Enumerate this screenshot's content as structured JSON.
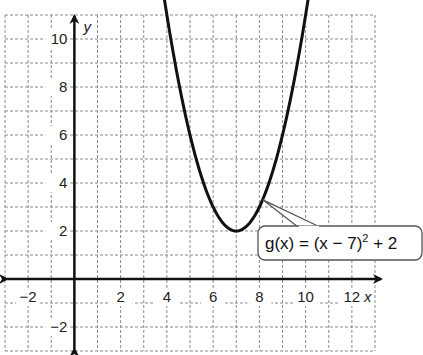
{
  "chart_data": {
    "type": "line",
    "title": "",
    "xlabel": "x",
    "ylabel": "y",
    "xlim": [
      -3,
      13
    ],
    "ylim": [
      -3,
      11
    ],
    "grid": true,
    "grid_style": "dashed",
    "x_ticks": [
      -2,
      2,
      4,
      6,
      8,
      10,
      12
    ],
    "x_tick_labels": [
      "−2",
      "2",
      "4",
      "6",
      "8",
      "10",
      "12"
    ],
    "y_ticks": [
      -2,
      2,
      4,
      6,
      8,
      10
    ],
    "y_tick_labels": [
      "−2",
      "2",
      "4",
      "6",
      "8",
      "10"
    ],
    "series": [
      {
        "name": "g(x) = (x − 7)² + 2",
        "function": "(x-7)^2+2",
        "vertex": [
          7,
          2
        ],
        "x_range": [
          3.84,
          10.16
        ],
        "x": [
          4,
          5,
          6,
          7,
          8,
          9,
          10
        ],
        "y": [
          11,
          6,
          3,
          2,
          3,
          6,
          11
        ],
        "arrows_at_ends": true
      }
    ],
    "annotations": [
      {
        "text_parts": [
          "g(x) = (x − 7)",
          "2",
          " + 2"
        ],
        "points_to": [
          8.2,
          3.4
        ],
        "style": "rounded-callout"
      }
    ]
  },
  "labels": {
    "x_axis": "x",
    "y_axis": "y",
    "callout_main": "g(x) = (x − 7)",
    "callout_sup": "2",
    "callout_tail": " + 2"
  }
}
